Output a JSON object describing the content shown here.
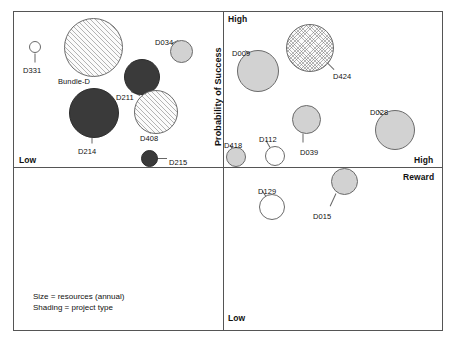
{
  "chart_data": {
    "type": "scatter",
    "title": "",
    "xlabel": "Reward",
    "ylabel": "Probability of Success",
    "x_axis_low_label": "Low",
    "x_axis_high_label": "High",
    "y_axis_low_label": "Low",
    "y_axis_high_label": "High",
    "grid": false,
    "legend_position": "bottom-left",
    "quadrant_matrix": true,
    "series": [
      {
        "name": "projects",
        "points": [
          {
            "label": "D331",
            "quadrant": "high-probability-low-reward",
            "size": "x-small",
            "shading": "white",
            "cx": 35,
            "cy": 47,
            "r": 6,
            "label_x": 23,
            "label_y": 66,
            "leader": {
              "x1": 35,
              "y1": 53,
              "x2": 35,
              "y2": 62
            }
          },
          {
            "label": "Bundle-D",
            "quadrant": "high-probability-low-reward",
            "size": "x-large",
            "shading": "hatch",
            "cx": 93,
            "cy": 47,
            "r": 29.5,
            "label_x": 58,
            "label_y": 77,
            "leader": {
              "x1": 75,
              "y1": 66,
              "x2": 92,
              "y2": 72
            }
          },
          {
            "label": "D034",
            "quadrant": "high-probability-low-reward",
            "size": "small",
            "shading": "gray",
            "cx": 181,
            "cy": 51,
            "r": 11.5,
            "label_x": 155,
            "label_y": 38,
            "leader": {
              "x1": 172,
              "y1": 43,
              "x2": 178,
              "y2": 40
            }
          },
          {
            "label": "D211",
            "quadrant": "high-probability-low-reward",
            "size": "medium",
            "shading": "dark",
            "cx": 142,
            "cy": 77,
            "r": 18,
            "label_x": 116,
            "label_y": 93,
            "leader": {
              "x1": 131,
              "y1": 91,
              "x2": 140,
              "y2": 95
            }
          },
          {
            "label": "D214",
            "quadrant": "high-probability-low-reward",
            "size": "large",
            "shading": "dark",
            "cx": 94,
            "cy": 113,
            "r": 25,
            "label_x": 78,
            "label_y": 147,
            "leader": {
              "x1": 92,
              "y1": 137,
              "x2": 92,
              "y2": 143
            }
          },
          {
            "label": "D408",
            "quadrant": "high-probability-low-reward",
            "size": "large",
            "shading": "hatch",
            "cx": 156,
            "cy": 112,
            "r": 22,
            "label_x": 140,
            "label_y": 134,
            "leader": {
              "x1": 150,
              "y1": 133,
              "x2": 152,
              "y2": 130
            }
          },
          {
            "label": "D215",
            "quadrant": "high-probability-low-reward",
            "size": "small",
            "shading": "dark",
            "cx": 149,
            "cy": 158,
            "r": 8.5,
            "label_x": 169,
            "label_y": 158,
            "leader": {
              "x1": 157,
              "y1": 158,
              "x2": 167,
              "y2": 158
            }
          },
          {
            "label": "D009",
            "quadrant": "high-probability-high-reward",
            "size": "large",
            "shading": "gray",
            "cx": 258,
            "cy": 71,
            "r": 21,
            "label_x": 232,
            "label_y": 49,
            "leader": {
              "x1": 251,
              "y1": 54,
              "x2": 245,
              "y2": 50
            }
          },
          {
            "label": "D424",
            "quadrant": "high-probability-high-reward",
            "size": "x-large",
            "shading": "crosshatch",
            "cx": 310,
            "cy": 48,
            "r": 24,
            "label_x": 333,
            "label_y": 72,
            "leader": {
              "x1": 327,
              "y1": 62,
              "x2": 334,
              "y2": 69
            }
          },
          {
            "label": "D028",
            "quadrant": "high-probability-high-reward",
            "size": "large",
            "shading": "gray",
            "cx": 395,
            "cy": 130,
            "r": 20,
            "label_x": 370,
            "label_y": 108,
            "leader": {
              "x1": 383,
              "y1": 115,
              "x2": 378,
              "y2": 110
            }
          },
          {
            "label": "D039",
            "quadrant": "high-probability-high-reward",
            "size": "medium",
            "shading": "gray",
            "cx": 306,
            "cy": 119,
            "r": 14.5,
            "label_x": 300,
            "label_y": 148,
            "leader": {
              "x1": 303,
              "y1": 133,
              "x2": 303,
              "y2": 142
            }
          },
          {
            "label": "D112",
            "quadrant": "high-probability-high-reward",
            "size": "small",
            "shading": "white",
            "cx": 275,
            "cy": 156,
            "r": 10,
            "label_x": 259,
            "label_y": 135,
            "leader": {
              "x1": 270,
              "y1": 147,
              "x2": 266,
              "y2": 140
            }
          },
          {
            "label": "D418",
            "quadrant": "high-probability-high-reward",
            "size": "small",
            "shading": "gray",
            "cx": 236,
            "cy": 157,
            "r": 10,
            "label_x": 224,
            "label_y": 141,
            "leader": {
              "x1": 232,
              "y1": 148,
              "x2": 230,
              "y2": 144
            }
          },
          {
            "label": "D129",
            "quadrant": "low-probability-high-reward",
            "size": "medium",
            "shading": "white",
            "cx": 272,
            "cy": 207,
            "r": 13,
            "label_x": 258,
            "label_y": 187,
            "leader": {
              "x1": 266,
              "y1": 196,
              "x2": 262,
              "y2": 190
            }
          },
          {
            "label": "D015",
            "quadrant": "low-probability-high-reward",
            "size": "medium",
            "shading": "gray",
            "cx": 344,
            "cy": 181,
            "r": 13.5,
            "label_x": 313,
            "label_y": 212,
            "leader": {
              "x1": 336,
              "y1": 193,
              "x2": 330,
              "y2": 206
            }
          }
        ]
      }
    ]
  },
  "axes": {
    "y_title": "Probability of Success",
    "y_high": "High",
    "y_low": "Low",
    "x_title": "Reward",
    "x_high": "High",
    "x_low": "Low"
  },
  "legend": {
    "line1": "Size = resources (annual)",
    "line2": "Shading = project type"
  }
}
